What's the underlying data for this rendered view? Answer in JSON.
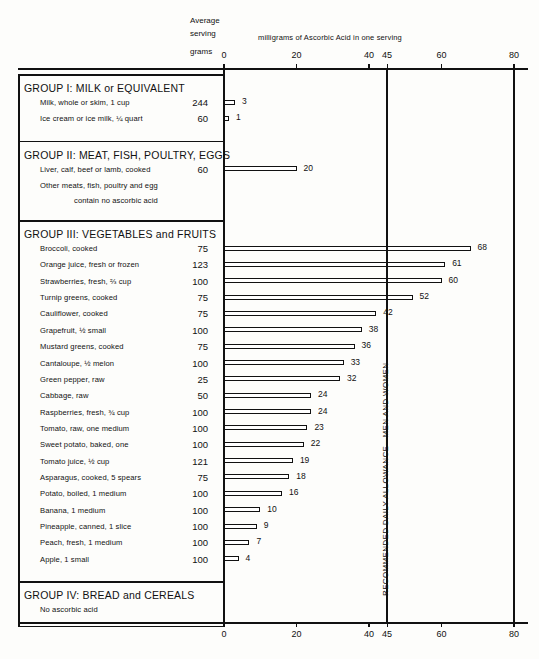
{
  "header": {
    "avg_serving_line1": "Average",
    "avg_serving_line2": "serving",
    "avg_serving_line3": "grams",
    "units_caption": "milligrams of Ascorbic Acid in one serving"
  },
  "axis": {
    "ticks": [
      0,
      20,
      40,
      45,
      60,
      80
    ],
    "tick_labels": [
      "0",
      "20",
      "40",
      "45",
      "60",
      "80"
    ],
    "min": 0,
    "max": 80
  },
  "rda": {
    "value": 45,
    "label": "RECOMMENDED DAILY ALLOWANCE—MEN AND WOMEN"
  },
  "groups": [
    {
      "title": "GROUP I: MILK or EQUIVALENT",
      "items": [
        {
          "label": "Milk, whole or skim, 1 cup",
          "grams": "244",
          "value": 3,
          "value_label": "3"
        },
        {
          "label": "Ice cream or ice milk, ¼ quart",
          "grams": "60",
          "value": 1,
          "value_label": "1"
        }
      ],
      "notes": []
    },
    {
      "title": "GROUP II: MEAT, FISH, POULTRY, EGGS",
      "items": [
        {
          "label": "Liver, calf, beef or lamb, cooked",
          "grams": "60",
          "value": 20,
          "value_label": "20"
        }
      ],
      "notes": [
        "Other meats, fish, poultry and egg",
        "contain no ascorbic acid"
      ]
    },
    {
      "title": "GROUP III: VEGETABLES and FRUITS",
      "items": [
        {
          "label": "Broccoli, cooked",
          "grams": "75",
          "value": 68,
          "value_label": "68"
        },
        {
          "label": "Orange juice, fresh or frozen",
          "grams": "123",
          "value": 61,
          "value_label": "61"
        },
        {
          "label": "Strawberries, fresh, ⅔ cup",
          "grams": "100",
          "value": 60,
          "value_label": "60"
        },
        {
          "label": "Turnip greens, cooked",
          "grams": "75",
          "value": 52,
          "value_label": "52"
        },
        {
          "label": "Cauliflower, cooked",
          "grams": "75",
          "value": 42,
          "value_label": "42"
        },
        {
          "label": "Grapefruit, ½ small",
          "grams": "100",
          "value": 38,
          "value_label": "38"
        },
        {
          "label": "Mustard greens, cooked",
          "grams": "75",
          "value": 36,
          "value_label": "36"
        },
        {
          "label": "Cantaloupe, ½ melon",
          "grams": "100",
          "value": 33,
          "value_label": "33"
        },
        {
          "label": "Green pepper, raw",
          "grams": "25",
          "value": 32,
          "value_label": "32"
        },
        {
          "label": "Cabbage, raw",
          "grams": "50",
          "value": 24,
          "value_label": "24"
        },
        {
          "label": "Raspberries, fresh, ¾ cup",
          "grams": "100",
          "value": 24,
          "value_label": "24"
        },
        {
          "label": "Tomato, raw, one medium",
          "grams": "100",
          "value": 23,
          "value_label": "23"
        },
        {
          "label": "Sweet potato, baked, one",
          "grams": "100",
          "value": 22,
          "value_label": "22"
        },
        {
          "label": "Tomato juice, ½ cup",
          "grams": "121",
          "value": 19,
          "value_label": "19"
        },
        {
          "label": "Asparagus, cooked, 5 spears",
          "grams": "75",
          "value": 18,
          "value_label": "18"
        },
        {
          "label": "Potato, boiled, 1 medium",
          "grams": "100",
          "value": 16,
          "value_label": "16"
        },
        {
          "label": "Banana, 1 medium",
          "grams": "100",
          "value": 10,
          "value_label": "10"
        },
        {
          "label": "Pineapple, canned, 1 slice",
          "grams": "100",
          "value": 9,
          "value_label": "9"
        },
        {
          "label": "Peach, fresh, 1 medium",
          "grams": "100",
          "value": 7,
          "value_label": "7"
        },
        {
          "label": "Apple, 1 small",
          "grams": "100",
          "value": 4,
          "value_label": "4"
        }
      ],
      "notes": []
    },
    {
      "title": "GROUP IV: BREAD and CEREALS",
      "items": [],
      "notes": [
        "No ascorbic acid"
      ]
    }
  ],
  "chart_data": {
    "type": "bar",
    "xlabel": "milligrams of Ascorbic Acid in one serving",
    "ylabel": "",
    "xlim": [
      0,
      80
    ],
    "grid": false,
    "orientation": "horizontal",
    "reference_line": {
      "value": 45,
      "label": "RECOMMENDED DAILY ALLOWANCE—MEN AND WOMEN"
    },
    "categories": [
      "Milk, whole or skim, 1 cup",
      "Ice cream or ice milk, ¼ quart",
      "Liver, calf, beef or lamb, cooked",
      "Broccoli, cooked",
      "Orange juice, fresh or frozen",
      "Strawberries, fresh, ⅔ cup",
      "Turnip greens, cooked",
      "Cauliflower, cooked",
      "Grapefruit, ½ small",
      "Mustard greens, cooked",
      "Cantaloupe, ½ melon",
      "Green pepper, raw",
      "Cabbage, raw",
      "Raspberries, fresh, ¾ cup",
      "Tomato, raw, one medium",
      "Sweet potato, baked, one",
      "Tomato juice, ½ cup",
      "Asparagus, cooked, 5 spears",
      "Potato, boiled, 1 medium",
      "Banana, 1 medium",
      "Pineapple, canned, 1 slice",
      "Peach, fresh, 1 medium",
      "Apple, 1 small"
    ],
    "values": [
      3,
      1,
      20,
      68,
      61,
      60,
      52,
      42,
      38,
      36,
      33,
      32,
      24,
      24,
      23,
      22,
      19,
      18,
      16,
      10,
      9,
      7,
      4
    ],
    "serving_grams": [
      244,
      60,
      60,
      75,
      123,
      100,
      75,
      75,
      100,
      75,
      100,
      25,
      50,
      100,
      100,
      100,
      121,
      75,
      100,
      100,
      100,
      100,
      100
    ],
    "tick_values": [
      0,
      20,
      40,
      45,
      60,
      80
    ]
  }
}
